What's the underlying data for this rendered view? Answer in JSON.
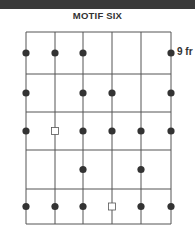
{
  "title": "MOTIF SIX",
  "diagram": {
    "type": "guitar-scale-diagram",
    "strings": 6,
    "frets_shown": 5,
    "start_fret_label": "9 fr",
    "dot_color": "#333333",
    "line_color": "#555555",
    "positions": [
      {
        "fret": 1,
        "string": 1,
        "marker": "dot"
      },
      {
        "fret": 1,
        "string": 2,
        "marker": "dot"
      },
      {
        "fret": 1,
        "string": 3,
        "marker": "dot"
      },
      {
        "fret": 1,
        "string": 6,
        "marker": "dot"
      },
      {
        "fret": 2,
        "string": 1,
        "marker": "dot"
      },
      {
        "fret": 2,
        "string": 3,
        "marker": "dot"
      },
      {
        "fret": 2,
        "string": 4,
        "marker": "dot"
      },
      {
        "fret": 2,
        "string": 6,
        "marker": "dot"
      },
      {
        "fret": 3,
        "string": 1,
        "marker": "dot"
      },
      {
        "fret": 3,
        "string": 2,
        "marker": "square"
      },
      {
        "fret": 3,
        "string": 3,
        "marker": "dot"
      },
      {
        "fret": 3,
        "string": 4,
        "marker": "dot"
      },
      {
        "fret": 3,
        "string": 5,
        "marker": "dot"
      },
      {
        "fret": 3,
        "string": 6,
        "marker": "dot"
      },
      {
        "fret": 4,
        "string": 3,
        "marker": "dot"
      },
      {
        "fret": 4,
        "string": 5,
        "marker": "dot"
      },
      {
        "fret": 5,
        "string": 1,
        "marker": "dot"
      },
      {
        "fret": 5,
        "string": 2,
        "marker": "dot"
      },
      {
        "fret": 5,
        "string": 3,
        "marker": "dot"
      },
      {
        "fret": 5,
        "string": 4,
        "marker": "square"
      },
      {
        "fret": 5,
        "string": 5,
        "marker": "dot"
      },
      {
        "fret": 5,
        "string": 6,
        "marker": "dot"
      }
    ]
  }
}
